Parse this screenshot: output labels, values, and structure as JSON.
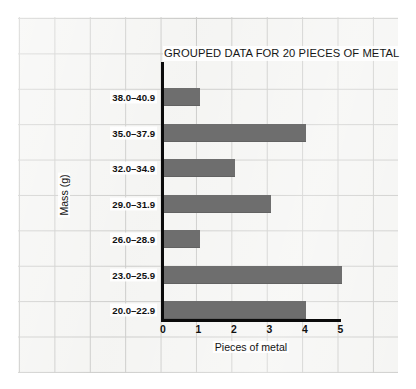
{
  "chart_data": {
    "type": "bar",
    "orientation": "horizontal",
    "title": "GROUPED DATA FOR 20 PIECES OF METAL",
    "xlabel": "Pieces of metal",
    "ylabel": "Mass (g)",
    "categories": [
      "20.0–22.9",
      "23.0–25.9",
      "26.0–28.9",
      "29.0–31.9",
      "32.0–34.9",
      "35.0–37.9",
      "38.0–40.9"
    ],
    "values": [
      4,
      5,
      1,
      3,
      2,
      4,
      1
    ],
    "xlim": [
      0,
      5
    ],
    "xticks": [
      "0",
      "1",
      "2",
      "3",
      "4",
      "5"
    ],
    "grid": "graph-paper-background",
    "legend": "none",
    "total": 20,
    "bar_color": "#6e6e6e",
    "axis_color": "#0b0b0b",
    "paper_color": "#f4f4f2",
    "gridline_color": "#c9c9c7"
  }
}
